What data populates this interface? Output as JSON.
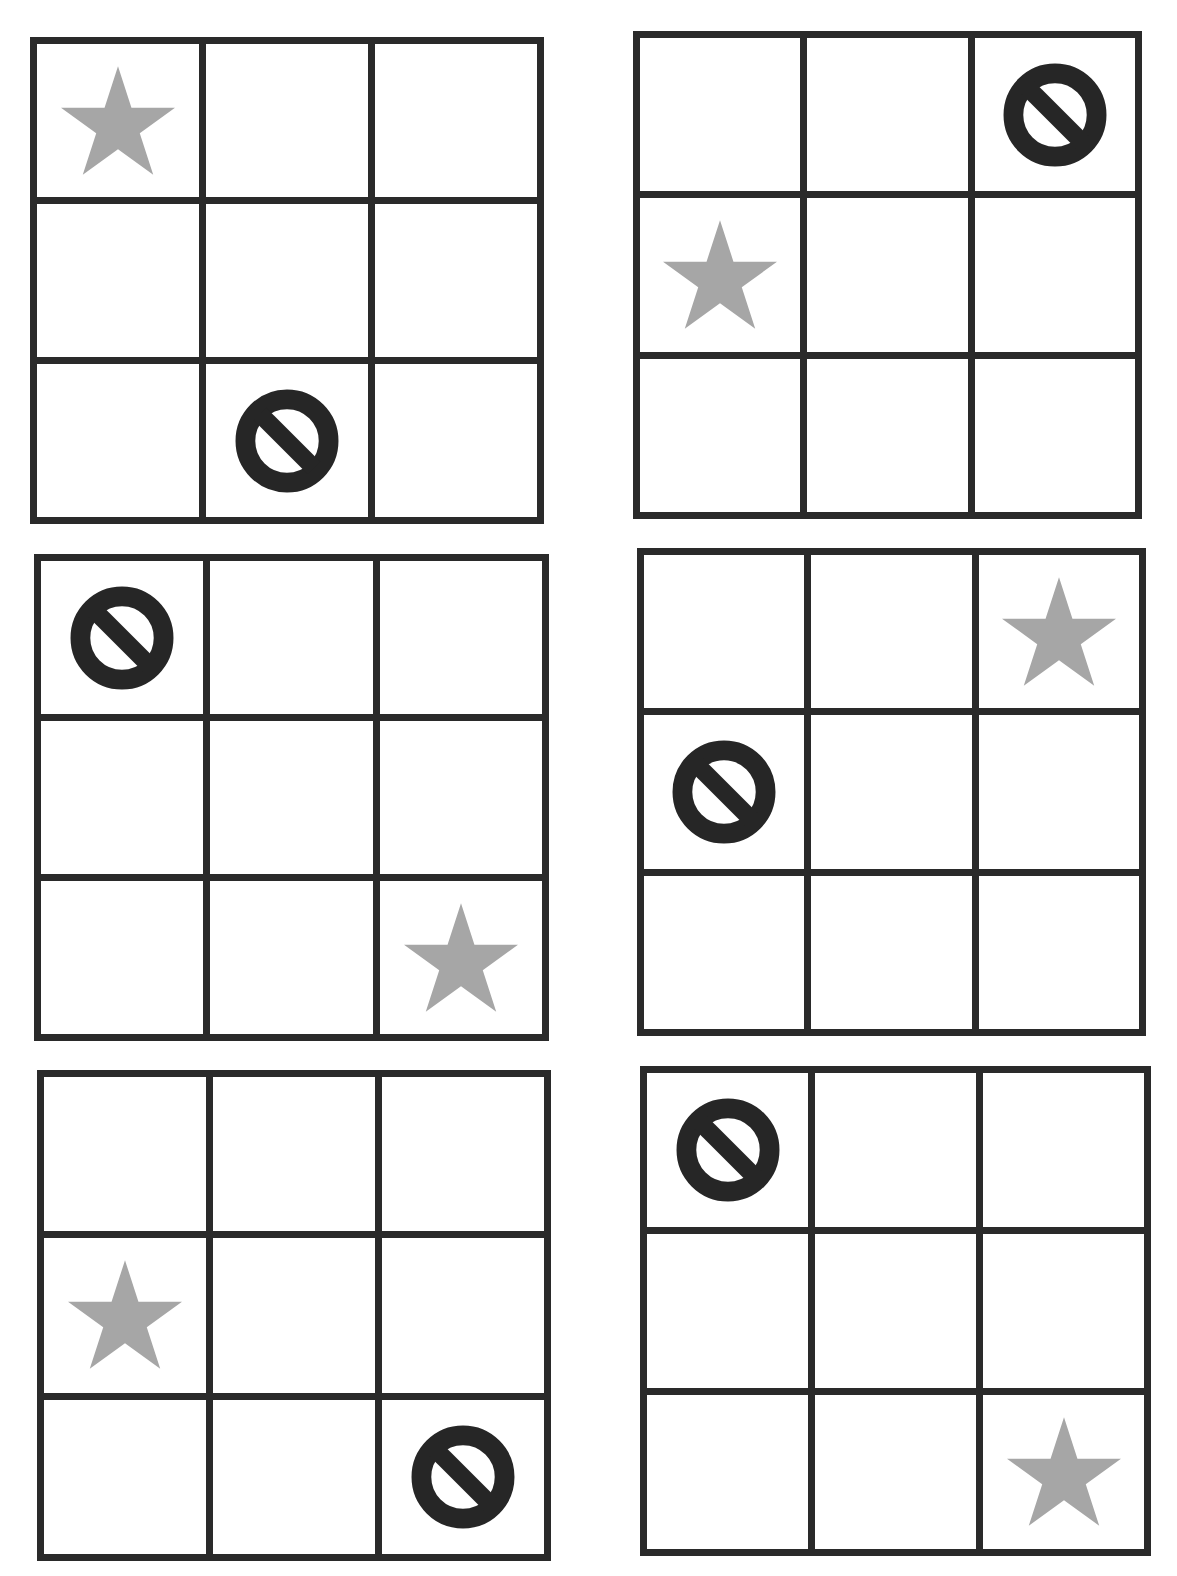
{
  "colors": {
    "grid_line": "#2a2a2a",
    "cell_background": "#ffffff",
    "star": "#a6a6a6",
    "no_symbol": "#262626"
  },
  "grid_size": {
    "rows": 3,
    "cols": 3
  },
  "grids": [
    {
      "id": "grid-1",
      "position": "top-left",
      "box": {
        "left": 30,
        "top": 37,
        "width": 514,
        "height": 487
      },
      "cells": [
        [
          "star",
          "",
          ""
        ],
        [
          "",
          "",
          ""
        ],
        [
          "",
          "no",
          ""
        ]
      ]
    },
    {
      "id": "grid-2",
      "position": "top-right",
      "box": {
        "left": 633,
        "top": 31,
        "width": 509,
        "height": 488
      },
      "cells": [
        [
          "",
          "",
          "no"
        ],
        [
          "star",
          "",
          ""
        ],
        [
          "",
          "",
          ""
        ]
      ]
    },
    {
      "id": "grid-3",
      "position": "middle-left",
      "box": {
        "left": 34,
        "top": 554,
        "width": 515,
        "height": 487
      },
      "cells": [
        [
          "no",
          "",
          ""
        ],
        [
          "",
          "",
          ""
        ],
        [
          "",
          "",
          "star"
        ]
      ]
    },
    {
      "id": "grid-4",
      "position": "middle-right",
      "box": {
        "left": 637,
        "top": 548,
        "width": 509,
        "height": 488
      },
      "cells": [
        [
          "",
          "",
          "star"
        ],
        [
          "no",
          "",
          ""
        ],
        [
          "",
          "",
          ""
        ]
      ]
    },
    {
      "id": "grid-5",
      "position": "bottom-left",
      "box": {
        "left": 37,
        "top": 1070,
        "width": 514,
        "height": 491
      },
      "cells": [
        [
          "",
          "",
          ""
        ],
        [
          "star",
          "",
          ""
        ],
        [
          "",
          "",
          "no"
        ]
      ]
    },
    {
      "id": "grid-6",
      "position": "bottom-right",
      "box": {
        "left": 640,
        "top": 1066,
        "width": 511,
        "height": 490
      },
      "cells": [
        [
          "no",
          "",
          ""
        ],
        [
          "",
          "",
          ""
        ],
        [
          "",
          "",
          "star"
        ]
      ]
    }
  ],
  "icons": {
    "star": "star-icon",
    "no": "no-symbol-icon"
  }
}
